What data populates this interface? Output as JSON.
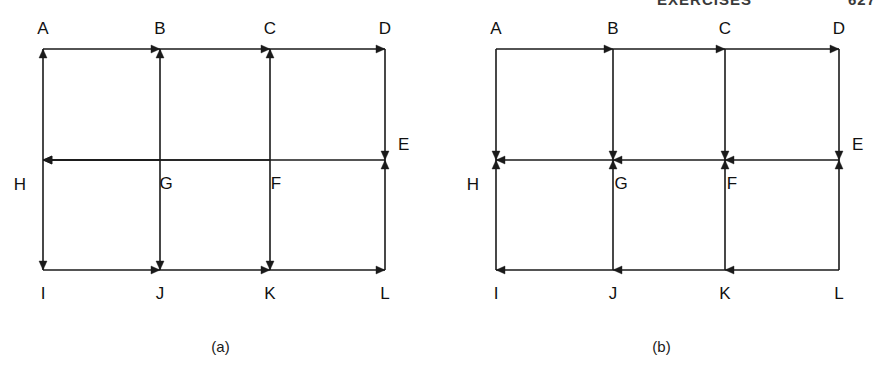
{
  "running_head": {
    "title": "EXERCISES",
    "page_number": "627"
  },
  "figures": [
    {
      "id": "a",
      "caption": "(a)",
      "nodes": [
        {
          "id": "A",
          "label": "A",
          "x": 43,
          "y": 49,
          "label_x": 43,
          "label_y": 34,
          "anchor": "middle"
        },
        {
          "id": "B",
          "label": "B",
          "x": 160,
          "y": 49,
          "label_x": 160,
          "label_y": 34,
          "anchor": "middle"
        },
        {
          "id": "C",
          "label": "C",
          "x": 270,
          "y": 49,
          "label_x": 270,
          "label_y": 34,
          "anchor": "middle"
        },
        {
          "id": "D",
          "label": "D",
          "x": 385,
          "y": 49,
          "label_x": 385,
          "label_y": 34,
          "anchor": "middle"
        },
        {
          "id": "E",
          "label": "E",
          "x": 385,
          "y": 160,
          "label_x": 398,
          "label_y": 150,
          "anchor": "start"
        },
        {
          "id": "F",
          "label": "F",
          "x": 270,
          "y": 160,
          "label_x": 276,
          "label_y": 189,
          "anchor": "middle"
        },
        {
          "id": "G",
          "label": "G",
          "x": 160,
          "y": 160,
          "label_x": 166,
          "label_y": 189,
          "anchor": "middle"
        },
        {
          "id": "H",
          "label": "H",
          "x": 43,
          "y": 160,
          "label_x": 20,
          "label_y": 190,
          "anchor": "middle"
        },
        {
          "id": "I",
          "label": "I",
          "x": 43,
          "y": 270,
          "label_x": 43,
          "label_y": 299,
          "anchor": "middle"
        },
        {
          "id": "J",
          "label": "J",
          "x": 160,
          "y": 270,
          "label_x": 160,
          "label_y": 299,
          "anchor": "middle"
        },
        {
          "id": "K",
          "label": "K",
          "x": 270,
          "y": 270,
          "label_x": 270,
          "label_y": 299,
          "anchor": "middle"
        },
        {
          "id": "L",
          "label": "L",
          "x": 385,
          "y": 270,
          "label_x": 385,
          "label_y": 299,
          "anchor": "middle"
        }
      ],
      "edges": [
        {
          "from": "A",
          "to": "B",
          "dir": "right"
        },
        {
          "from": "B",
          "to": "C",
          "dir": "right"
        },
        {
          "from": "C",
          "to": "D",
          "dir": "right"
        },
        {
          "from": "D",
          "to": "E",
          "dir": "down"
        },
        {
          "from": "E",
          "to": "H",
          "dir": "left"
        },
        {
          "from": "F",
          "to": "H",
          "dir": "left"
        },
        {
          "from": "G",
          "to": "H",
          "dir": "left"
        },
        {
          "from": "H",
          "to": "A",
          "dir": "up"
        },
        {
          "from": "H",
          "to": "I",
          "dir": "down"
        },
        {
          "from": "G",
          "to": "B",
          "dir": "up"
        },
        {
          "from": "G",
          "to": "J",
          "dir": "down"
        },
        {
          "from": "F",
          "to": "C",
          "dir": "up"
        },
        {
          "from": "F",
          "to": "K",
          "dir": "down"
        },
        {
          "from": "I",
          "to": "J",
          "dir": "right"
        },
        {
          "from": "J",
          "to": "K",
          "dir": "right"
        },
        {
          "from": "K",
          "to": "L",
          "dir": "right"
        },
        {
          "from": "L",
          "to": "E",
          "dir": "up"
        }
      ]
    },
    {
      "id": "b",
      "caption": "(b)",
      "nodes": [
        {
          "id": "A",
          "label": "A",
          "x": 55,
          "y": 49,
          "label_x": 55,
          "label_y": 34,
          "anchor": "middle"
        },
        {
          "id": "B",
          "label": "B",
          "x": 172,
          "y": 49,
          "label_x": 172,
          "label_y": 34,
          "anchor": "middle"
        },
        {
          "id": "C",
          "label": "C",
          "x": 284,
          "y": 49,
          "label_x": 284,
          "label_y": 34,
          "anchor": "middle"
        },
        {
          "id": "D",
          "label": "D",
          "x": 398,
          "y": 49,
          "label_x": 398,
          "label_y": 34,
          "anchor": "middle"
        },
        {
          "id": "E",
          "label": "E",
          "x": 398,
          "y": 160,
          "label_x": 411,
          "label_y": 150,
          "anchor": "start"
        },
        {
          "id": "F",
          "label": "F",
          "x": 284,
          "y": 160,
          "label_x": 291,
          "label_y": 189,
          "anchor": "middle"
        },
        {
          "id": "G",
          "label": "G",
          "x": 172,
          "y": 160,
          "label_x": 180,
          "label_y": 189,
          "anchor": "middle"
        },
        {
          "id": "H",
          "label": "H",
          "x": 55,
          "y": 160,
          "label_x": 32,
          "label_y": 190,
          "anchor": "middle"
        },
        {
          "id": "I",
          "label": "I",
          "x": 55,
          "y": 270,
          "label_x": 55,
          "label_y": 299,
          "anchor": "middle"
        },
        {
          "id": "J",
          "label": "J",
          "x": 172,
          "y": 270,
          "label_x": 172,
          "label_y": 299,
          "anchor": "middle"
        },
        {
          "id": "K",
          "label": "K",
          "x": 284,
          "y": 270,
          "label_x": 284,
          "label_y": 299,
          "anchor": "middle"
        },
        {
          "id": "L",
          "label": "L",
          "x": 398,
          "y": 270,
          "label_x": 398,
          "label_y": 299,
          "anchor": "middle"
        }
      ],
      "edges": [
        {
          "from": "A",
          "to": "B",
          "dir": "right"
        },
        {
          "from": "B",
          "to": "C",
          "dir": "right"
        },
        {
          "from": "C",
          "to": "D",
          "dir": "right"
        },
        {
          "from": "D",
          "to": "E",
          "dir": "down"
        },
        {
          "from": "E",
          "to": "F",
          "dir": "left"
        },
        {
          "from": "F",
          "to": "G",
          "dir": "left"
        },
        {
          "from": "G",
          "to": "H",
          "dir": "left"
        },
        {
          "from": "A",
          "to": "H",
          "dir": "down"
        },
        {
          "from": "I",
          "to": "H",
          "dir": "up"
        },
        {
          "from": "B",
          "to": "G",
          "dir": "down"
        },
        {
          "from": "J",
          "to": "G",
          "dir": "up"
        },
        {
          "from": "C",
          "to": "F",
          "dir": "down"
        },
        {
          "from": "K",
          "to": "F",
          "dir": "up"
        },
        {
          "from": "J",
          "to": "I",
          "dir": "left"
        },
        {
          "from": "K",
          "to": "J",
          "dir": "left"
        },
        {
          "from": "L",
          "to": "K",
          "dir": "left"
        },
        {
          "from": "L",
          "to": "E",
          "dir": "up"
        }
      ]
    }
  ],
  "style": {
    "line_color": "#1a1a1a",
    "line_width": 1.6,
    "background": "#ffffff"
  }
}
